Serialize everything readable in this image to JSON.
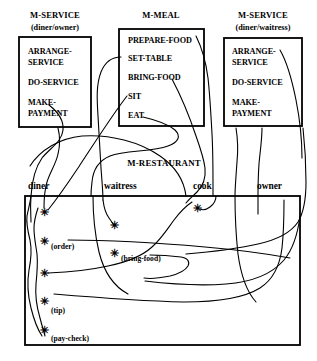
{
  "diagram": {
    "type": "object-oriented-module-diagram",
    "modules": [
      {
        "id": "m-service-diner-owner",
        "title": "M-SERVICE",
        "subtitle": "(diner/owner)",
        "operations": [
          "ARRANGE-",
          "SERVICE",
          "DO-SERVICE",
          "MAKE-",
          "PAYMENT"
        ]
      },
      {
        "id": "m-meal",
        "title": "M-MEAL",
        "subtitle": "",
        "operations": [
          "PREPARE-FOOD",
          "SET-TABLE",
          "BRING-FOOD",
          "SIT",
          "EAT"
        ]
      },
      {
        "id": "m-service-diner-waitress",
        "title": "M-SERVICE",
        "subtitle": "(diner/waitress)",
        "operations": [
          "ARRANGE-",
          "SERVICE",
          "DO-SERVICE",
          "MAKE-",
          "PAYMENT"
        ]
      }
    ],
    "restaurant": {
      "title": "M-RESTAURANT",
      "roles": [
        "diner",
        "waitress",
        "cook",
        "owner"
      ],
      "message_labels": [
        "(order)",
        "(bring-food)",
        "(tip)",
        "(pay-check)"
      ],
      "star_glyph": "✳"
    },
    "colors": {
      "background": "#ffffff",
      "ink": "#000000"
    }
  }
}
